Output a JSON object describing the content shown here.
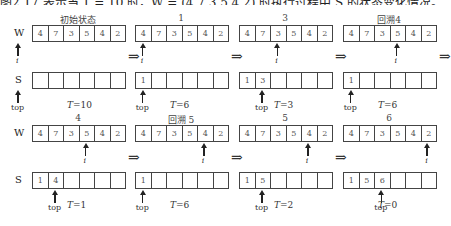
{
  "header": {
    "text": "图2.17 表示当 T = 10 时，W = (4,7,3,5,4,2) 时执行过程中 S 的状态变化情况。"
  },
  "labels": {
    "w": "W",
    "s": "S",
    "top": "top",
    "i": "i",
    "t_prefix": "T",
    "implies": "⇒"
  },
  "rows": [
    {
      "panels": [
        {
          "caption": "初始状态",
          "w": [
            "4",
            "7",
            "3",
            "5",
            "4",
            "2"
          ],
          "i_index": -1,
          "s": [
            "",
            "",
            "",
            "",
            "",
            ""
          ],
          "top_index": -1,
          "T": "=10"
        },
        {
          "caption": "1",
          "w": [
            "4",
            "7",
            "3",
            "5",
            "4",
            "2"
          ],
          "i_index": 0,
          "s": [
            "1",
            "",
            "",
            "",
            "",
            ""
          ],
          "top_index": 0,
          "T": "=6"
        },
        {
          "caption": "3",
          "w": [
            "4",
            "7",
            "3",
            "5",
            "4",
            "2"
          ],
          "i_index": 2,
          "s": [
            "1",
            "3",
            "",
            "",
            "",
            ""
          ],
          "top_index": 1,
          "T": "=3"
        },
        {
          "caption": "回溯4",
          "w": [
            "4",
            "7",
            "3",
            "5",
            "4",
            "2"
          ],
          "i_index": 3,
          "s": [
            "1",
            "",
            "",
            "",
            "",
            ""
          ],
          "top_index": 0,
          "T": "=6"
        }
      ]
    },
    {
      "panels": [
        {
          "caption": "4",
          "w": [
            "4",
            "7",
            "3",
            "5",
            "4",
            "2"
          ],
          "i_index": 3,
          "s": [
            "1",
            "4",
            "",
            "",
            "",
            ""
          ],
          "top_index": 1,
          "T": "=1"
        },
        {
          "caption": "回溯   5",
          "w": [
            "4",
            "7",
            "3",
            "5",
            "4",
            "2"
          ],
          "i_index": 4,
          "s": [
            "1",
            "",
            "",
            "",
            "",
            ""
          ],
          "top_index": 0,
          "T": "=6"
        },
        {
          "caption": "5",
          "w": [
            "4",
            "7",
            "3",
            "5",
            "4",
            "2"
          ],
          "i_index": 4,
          "s": [
            "1",
            "5",
            "",
            "",
            "",
            ""
          ],
          "top_index": 1,
          "T": "=2"
        },
        {
          "caption": "6",
          "w": [
            "4",
            "7",
            "3",
            "5",
            "4",
            "2"
          ],
          "i_index": 5,
          "s": [
            "1",
            "5",
            "6",
            "",
            "",
            ""
          ],
          "top_index": 2,
          "T": "=0"
        }
      ]
    }
  ]
}
